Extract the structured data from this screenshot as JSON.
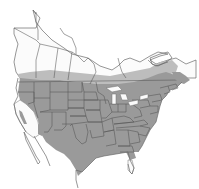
{
  "map": {
    "title": "",
    "type": "species range map",
    "region": "North America (Canada, United States, Mexico)",
    "colors": {
      "background": "#ffffff",
      "land": "#fbfbfb",
      "range": "#9a9a9a",
      "range_edge": "#bdbdbd",
      "borders": "#555555"
    },
    "range_description": "Shaded range covers most of the contiguous United States and southern Canada; excludes California, Nevada, western Arizona and southern Florida",
    "labels": []
  }
}
